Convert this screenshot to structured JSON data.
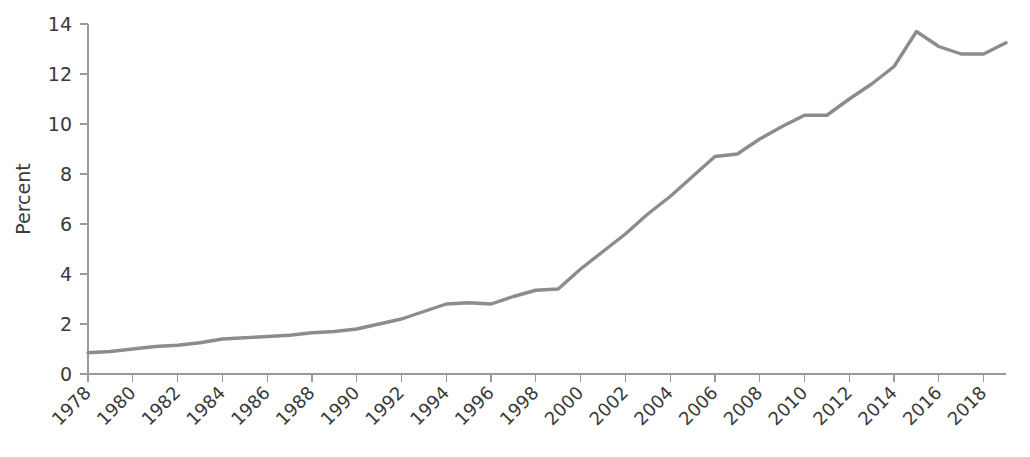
{
  "chart_data": {
    "type": "line",
    "title": "",
    "subtitle": "",
    "xlabel": "",
    "ylabel": "Percent",
    "grid": false,
    "legend": "none",
    "line_color": "#8c8c8c",
    "axis_color": "#9a9a9a",
    "xlim": [
      1978,
      2019
    ],
    "ylim": [
      0,
      14
    ],
    "ytick_labels": [
      "0",
      "2",
      "4",
      "6",
      "8",
      "10",
      "12",
      "14"
    ],
    "ytick_values": [
      0,
      2,
      4,
      6,
      8,
      10,
      12,
      14
    ],
    "xtick_labels": [
      "1978",
      "1980",
      "1982",
      "1984",
      "1986",
      "1988",
      "1990",
      "1992",
      "1994",
      "1996",
      "1998",
      "2000",
      "2002",
      "2004",
      "2006",
      "2008",
      "2010",
      "2012",
      "2014",
      "2016",
      "2018"
    ],
    "xtick_values": [
      1978,
      1980,
      1982,
      1984,
      1986,
      1988,
      1990,
      1992,
      1994,
      1996,
      1998,
      2000,
      2002,
      2004,
      2006,
      2008,
      2010,
      2012,
      2014,
      2016,
      2018
    ],
    "x": [
      1978,
      1979,
      1980,
      1981,
      1982,
      1983,
      1984,
      1985,
      1986,
      1987,
      1988,
      1989,
      1990,
      1991,
      1992,
      1993,
      1994,
      1995,
      1996,
      1997,
      1998,
      1999,
      2000,
      2001,
      2002,
      2003,
      2004,
      2005,
      2006,
      2007,
      2008,
      2009,
      2010,
      2011,
      2012,
      2013,
      2014,
      2015,
      2016,
      2017,
      2018,
      2019
    ],
    "values": [
      0.85,
      0.9,
      1.0,
      1.1,
      1.15,
      1.25,
      1.4,
      1.45,
      1.5,
      1.55,
      1.65,
      1.7,
      1.8,
      2.0,
      2.2,
      2.5,
      2.8,
      2.85,
      2.8,
      3.1,
      3.35,
      3.4,
      4.2,
      4.9,
      5.6,
      6.4,
      7.1,
      7.9,
      8.7,
      8.8,
      9.4,
      9.9,
      10.35,
      10.35,
      11.0,
      11.6,
      12.3,
      13.7,
      13.1,
      12.8,
      12.8,
      13.25
    ],
    "series": [
      {
        "name": "Percent",
        "values": [
          0.85,
          0.9,
          1.0,
          1.1,
          1.15,
          1.25,
          1.4,
          1.45,
          1.5,
          1.55,
          1.65,
          1.7,
          1.8,
          2.0,
          2.2,
          2.5,
          2.8,
          2.85,
          2.8,
          3.1,
          3.35,
          3.4,
          4.2,
          4.9,
          5.6,
          6.4,
          7.1,
          7.9,
          8.7,
          8.8,
          9.4,
          9.9,
          10.35,
          10.35,
          11.0,
          11.6,
          12.3,
          13.7,
          13.1,
          12.8,
          12.8,
          13.25
        ]
      }
    ]
  }
}
